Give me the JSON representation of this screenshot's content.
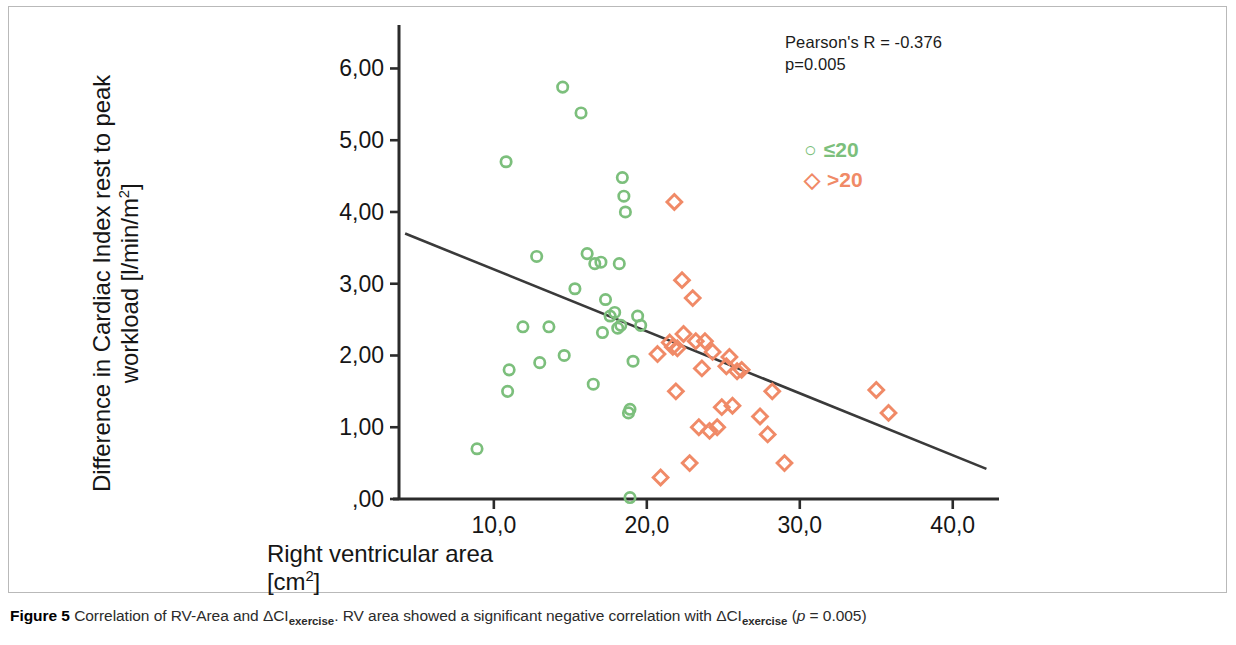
{
  "figure": {
    "caption_label": "Figure 5",
    "caption_text_1": " Correlation of RV-Area and ΔCI",
    "caption_sub_1": "exercise",
    "caption_text_2": ". RV area showed a significant negative correlation with ΔCI",
    "caption_sub_2": "exercise",
    "caption_text_3": " (",
    "caption_ital": "p",
    "caption_text_4": " = 0.005)"
  },
  "annotation": {
    "line1": "Pearson's R = -0.376",
    "line2": "p=0.005"
  },
  "legend": {
    "position": "top-right-inside",
    "items": [
      {
        "glyph": "circle-open",
        "symbol": "○",
        "label": "≤20",
        "color": "#7cbf7c"
      },
      {
        "glyph": "diamond-open",
        "symbol": "◇",
        "label": ">20",
        "color": "#f08a67"
      }
    ]
  },
  "chart_data": {
    "type": "scatter",
    "title": "",
    "xlabel": "Right ventricular area [cm2]",
    "xlabel_line1": "Right ventricular area",
    "xlabel_line2_pre": "[cm",
    "xlabel_line2_sup": "2",
    "xlabel_line2_post": "]",
    "ylabel": "Difference in Cardiac Index rest to peak workload [l/min/m2]",
    "ylabel_line1": "Difference in Cardiac Index rest to peak",
    "ylabel_line2_pre": "workload [l/min/m",
    "ylabel_line2_sup": "2",
    "ylabel_line2_post": "]",
    "grid": false,
    "xlim": [
      3.8,
      42.5
    ],
    "ylim": [
      0.0,
      6.55
    ],
    "xticks": [
      10,
      20,
      30,
      40
    ],
    "xticklabels": [
      "10,0",
      "20,0",
      "30,0",
      "40,0"
    ],
    "yticks": [
      0,
      1,
      2,
      3,
      4,
      5,
      6
    ],
    "yticklabels": [
      ",00",
      "1,00",
      "2,00",
      "3,00",
      "4,00",
      "5,00",
      "6,00"
    ],
    "decimal_separator": "comma",
    "regression_line": {
      "x_start": 4.2,
      "y_start": 3.7,
      "x_end": 42.2,
      "y_end": 0.42,
      "color": "#3a3a3a",
      "pearson_r": -0.376,
      "p_value": 0.005
    },
    "series": [
      {
        "name": "≤20",
        "marker": "circle-open",
        "color": "#7cbf7c",
        "points": [
          [
            8.9,
            0.7
          ],
          [
            10.8,
            4.7
          ],
          [
            10.9,
            1.5
          ],
          [
            11.0,
            1.8
          ],
          [
            11.9,
            2.4
          ],
          [
            12.8,
            3.38
          ],
          [
            13.0,
            1.9
          ],
          [
            13.6,
            2.4
          ],
          [
            14.5,
            5.74
          ],
          [
            14.6,
            2.0
          ],
          [
            15.3,
            2.93
          ],
          [
            15.7,
            5.38
          ],
          [
            16.1,
            3.42
          ],
          [
            16.5,
            1.6
          ],
          [
            16.6,
            3.28
          ],
          [
            17.0,
            3.3
          ],
          [
            17.1,
            2.32
          ],
          [
            17.3,
            2.78
          ],
          [
            17.6,
            2.55
          ],
          [
            17.9,
            2.6
          ],
          [
            18.1,
            2.38
          ],
          [
            18.2,
            3.28
          ],
          [
            18.3,
            2.42
          ],
          [
            18.4,
            4.48
          ],
          [
            18.5,
            4.22
          ],
          [
            18.6,
            4.0
          ],
          [
            18.8,
            1.2
          ],
          [
            18.9,
            1.25
          ],
          [
            18.9,
            0.02
          ],
          [
            19.1,
            1.92
          ],
          [
            19.4,
            2.55
          ],
          [
            19.6,
            2.42
          ]
        ]
      },
      {
        "name": ">20",
        "marker": "diamond-open",
        "color": "#f08a67",
        "points": [
          [
            20.7,
            2.02
          ],
          [
            20.9,
            0.3
          ],
          [
            21.5,
            2.18
          ],
          [
            21.7,
            2.12
          ],
          [
            21.8,
            4.14
          ],
          [
            21.9,
            1.5
          ],
          [
            22.0,
            2.1
          ],
          [
            22.3,
            3.05
          ],
          [
            22.4,
            2.3
          ],
          [
            22.8,
            0.5
          ],
          [
            23.0,
            2.8
          ],
          [
            23.2,
            2.2
          ],
          [
            23.4,
            1.0
          ],
          [
            23.6,
            1.82
          ],
          [
            23.8,
            2.2
          ],
          [
            24.1,
            0.95
          ],
          [
            24.3,
            2.05
          ],
          [
            24.6,
            1.0
          ],
          [
            24.9,
            1.28
          ],
          [
            25.2,
            1.85
          ],
          [
            25.4,
            1.98
          ],
          [
            25.6,
            1.3
          ],
          [
            25.9,
            1.78
          ],
          [
            26.2,
            1.8
          ],
          [
            27.4,
            1.15
          ],
          [
            27.9,
            0.9
          ],
          [
            28.2,
            1.5
          ],
          [
            29.0,
            0.5
          ],
          [
            35.0,
            1.52
          ],
          [
            35.8,
            1.2
          ]
        ]
      }
    ]
  }
}
